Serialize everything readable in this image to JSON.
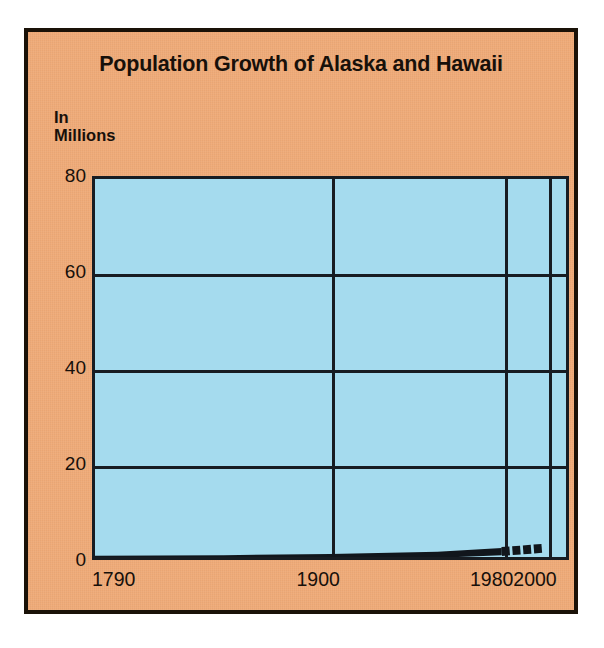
{
  "figure": {
    "title": "Population Growth of Alaska and Hawaii",
    "y_axis_label_line1": "In",
    "y_axis_label_line2": "Millions",
    "panel_color": "#f0ab78",
    "plot_color": "#a5dbee",
    "ink_color": "#171c22"
  },
  "chart_data": {
    "type": "line",
    "title": "Population Growth of Alaska and Hawaii",
    "xlabel": "",
    "ylabel": "In Millions",
    "ylim": [
      0,
      80
    ],
    "xlim": [
      1790,
      2010
    ],
    "grid": true,
    "legend": "none",
    "y_ticks": [
      "80",
      "60",
      "40",
      "20",
      "0"
    ],
    "y_tick_values": [
      80,
      60,
      40,
      20,
      0
    ],
    "x_ticks": [
      "1790",
      "1900",
      "1980",
      "2000"
    ],
    "x_tick_values": [
      1790,
      1900,
      1980,
      2000
    ],
    "series": [
      {
        "name": "Alaska and Hawaii population",
        "style": "solid",
        "color": "#11161c",
        "x": [
          1790,
          1850,
          1900,
          1950,
          1980
        ],
        "values": [
          0.0,
          0.1,
          0.3,
          0.7,
          1.4
        ]
      },
      {
        "name": "Projected population",
        "style": "dashed",
        "color": "#11161c",
        "x": [
          1980,
          2000
        ],
        "values": [
          1.4,
          2.1
        ]
      }
    ]
  }
}
